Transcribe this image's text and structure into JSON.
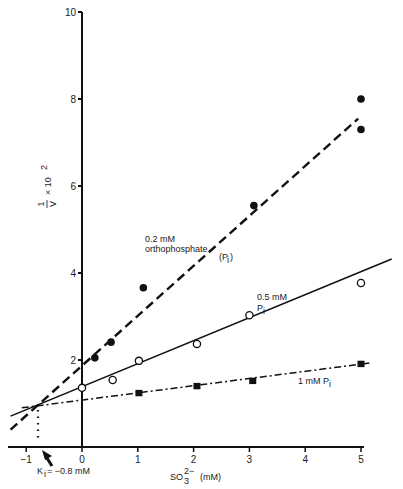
{
  "chart_data": {
    "type": "line",
    "title": "",
    "xlabel": "SO3 2- (mM)",
    "xlabel_main": "SO",
    "xlabel_sub": "3",
    "xlabel_sup": "2−",
    "xlabel_unit": "(mM)",
    "ylabel": "1/V x 10^2",
    "ylabel_num": "1",
    "ylabel_den": "V",
    "ylabel_mult": "× 10",
    "ylabel_exp": "2",
    "xlim": [
      -1.3,
      5.6
    ],
    "ylim": [
      0,
      10
    ],
    "grid": false,
    "legend": "inline annotations",
    "x_ticks": [
      -1,
      0,
      1,
      2,
      3,
      4,
      5
    ],
    "x_tick_labels": [
      "−1",
      "0",
      "1",
      "2",
      "3",
      "4",
      "5"
    ],
    "y_ticks": [
      2,
      4,
      6,
      8,
      10
    ],
    "y_tick_labels": [
      "2",
      "4",
      "6",
      "8",
      "10"
    ],
    "series": [
      {
        "name": "0.2 mM orthophosphate (Pi)",
        "label_line1": "0.2 mM",
        "label_line2": "orthophosphate",
        "label_line3": "(P",
        "label_sub": "i",
        "marker": "filled-circle",
        "line_style": "dashed",
        "points": [
          [
            0.23,
            2.05
          ],
          [
            0.52,
            2.41
          ],
          [
            1.1,
            3.66
          ],
          [
            3.08,
            5.55
          ],
          [
            5.0,
            8.0
          ],
          [
            5.0,
            7.3
          ]
        ],
        "fit_line": [
          [
            -1.28,
            0.4
          ],
          [
            4.95,
            7.55
          ]
        ]
      },
      {
        "name": "0.5 mM Pi",
        "label_line1": "0.5 mM",
        "label_line2": "P",
        "label_sub": "i",
        "marker": "open-circle",
        "line_style": "solid",
        "points": [
          [
            0.0,
            1.36
          ],
          [
            0.55,
            1.54
          ],
          [
            1.02,
            1.98
          ],
          [
            2.06,
            2.37
          ],
          [
            3.0,
            3.03
          ],
          [
            5.0,
            3.77
          ]
        ],
        "fit_line": [
          [
            -1.28,
            0.71
          ],
          [
            5.55,
            4.32
          ]
        ]
      },
      {
        "name": "1 mM Pi",
        "label_line1": "1 mM P",
        "label_sub": "i",
        "marker": "filled-square",
        "line_style": "dash-dot",
        "points": [
          [
            1.02,
            1.24
          ],
          [
            2.06,
            1.4
          ],
          [
            3.06,
            1.52
          ],
          [
            5.0,
            1.91
          ]
        ],
        "fit_line": [
          [
            -1.08,
            0.9
          ],
          [
            5.15,
            1.93
          ]
        ]
      }
    ],
    "annotations": [
      {
        "text": "K",
        "sub": "i",
        "rest": " = −0.8 mM",
        "x": -0.8,
        "y": 0.97,
        "note": "intersection point, arrow to x-axis"
      }
    ]
  }
}
